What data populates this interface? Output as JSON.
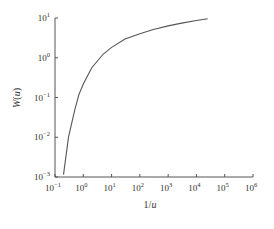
{
  "chart_data": {
    "type": "line",
    "title": "",
    "xlabel": "1/u",
    "ylabel": "W(u)",
    "xscale": "log",
    "yscale": "log",
    "xlim": [
      0.1,
      1000000
    ],
    "ylim": [
      0.001,
      10
    ],
    "grid": false,
    "legend": null,
    "x_tick_labels": [
      "10^-1",
      "10^0",
      "10^1",
      "10^2",
      "10^3",
      "10^4",
      "10^5",
      "10^6"
    ],
    "y_tick_labels": [
      "10^-3",
      "10^-2",
      "10^-1",
      "10^0",
      "10^1"
    ],
    "series": [
      {
        "name": "W(u)",
        "x": [
          0.2,
          0.3,
          0.5,
          0.7,
          1,
          2,
          5,
          10,
          30,
          100,
          300,
          1000,
          3000,
          10000,
          25000
        ],
        "y": [
          0.00115,
          0.0101,
          0.0489,
          0.118,
          0.219,
          0.56,
          1.223,
          1.823,
          2.96,
          4.038,
          5.128,
          6.332,
          7.43,
          8.633,
          9.55
        ]
      }
    ]
  },
  "axes": {
    "xlabel_base": "1/",
    "xlabel_var": "u",
    "ylabel_fn": "W",
    "ylabel_arg": "u"
  }
}
